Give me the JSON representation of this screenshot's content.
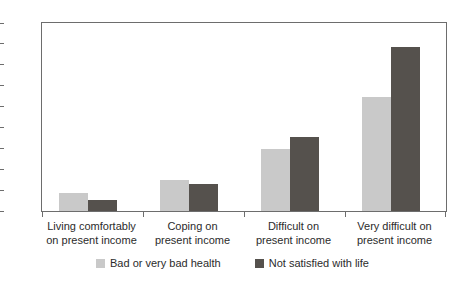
{
  "chart_data": {
    "type": "bar",
    "title": "",
    "subtitle": "",
    "xlabel": "",
    "ylabel": "",
    "ylim": [
      0,
      45
    ],
    "yticks": [
      0,
      5,
      10,
      15,
      20,
      25,
      30,
      35,
      40,
      45
    ],
    "grid": false,
    "legend_position": "bottom-center",
    "categories": [
      "Living comfortably on present income",
      "Coping on present income",
      "Difficult on present income",
      "Very difficult on present income"
    ],
    "category_lines": [
      [
        "Living comfortably",
        "on present income"
      ],
      [
        "Coping on",
        "present income"
      ],
      [
        "Difficult on",
        "present income"
      ],
      [
        "Very difficult on",
        "present income"
      ]
    ],
    "series": [
      {
        "name": "Bad or very bad health",
        "color": "#c9c9c9",
        "values": [
          4.3,
          7.5,
          14.8,
          27.3
        ]
      },
      {
        "name": "Not satisfied with life",
        "color": "#55514d",
        "values": [
          2.6,
          6.4,
          17.8,
          39.2
        ]
      }
    ]
  },
  "axis": {
    "tick_color": "#6d6d6d",
    "frame_color": "#6d6d6d",
    "label_color": "#2b2b2b"
  }
}
